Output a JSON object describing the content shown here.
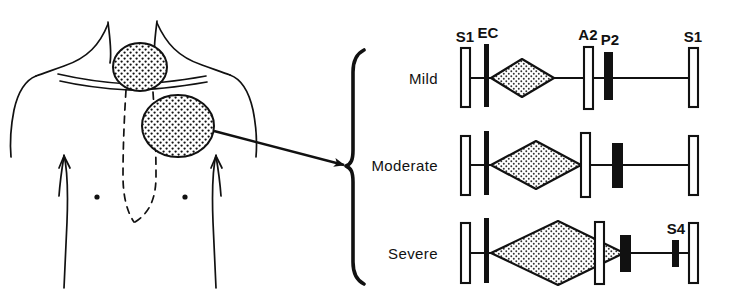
{
  "figure": {
    "background_color": "#ffffff",
    "ink_color": "#111111"
  },
  "anatomy": {
    "name": "chest-torso-diagram",
    "description": "Anterior chest outline with neck, clavicles, shoulders, sternum midline and two stippled auscultation areas",
    "nipple_marks": 2,
    "auscultation_areas": [
      {
        "name": "suprasternal-notch-area",
        "fill": "stipple"
      },
      {
        "name": "left-upper-sternal-border-area",
        "fill": "stipple"
      }
    ],
    "pointer": {
      "name": "arrow-to-phonocardiograms",
      "direction": "right-down"
    },
    "brace": {
      "name": "grouping-brace",
      "glyph": "{"
    }
  },
  "phonocardiogram": {
    "event_labels": {
      "s1": "S1",
      "ec": "EC",
      "a2": "A2",
      "p2": "P2",
      "s1_end": "S1",
      "s4": "S4"
    },
    "legend_colors": {
      "hollow_bar": "#ffffff",
      "hollow_bar_border": "#111111",
      "solid_bar": "#111111",
      "murmur_fill": "#d8d8d8",
      "murmur_outline": "#111111"
    },
    "rows": [
      {
        "label": "Mild",
        "severity": "mild",
        "markers": [
          {
            "id": "s1",
            "label": "S1",
            "type": "hollow",
            "show_label": true
          },
          {
            "id": "ec",
            "label": "EC",
            "type": "solid-tall",
            "show_label": true
          },
          {
            "id": "a2",
            "label": "A2",
            "type": "hollow",
            "show_label": true
          },
          {
            "id": "p2",
            "label": "P2",
            "type": "solid",
            "show_label": true
          },
          {
            "id": "s1_end",
            "label": "S1",
            "type": "hollow",
            "show_label": true
          }
        ],
        "murmur": {
          "shape": "diamond",
          "size": "small"
        },
        "a2_p2_split": "narrow",
        "has_s4": false
      },
      {
        "label": "Moderate",
        "severity": "moderate",
        "markers": [
          {
            "id": "s1",
            "label": "S1",
            "type": "hollow",
            "show_label": false
          },
          {
            "id": "ec",
            "label": "EC",
            "type": "solid-tall",
            "show_label": false
          },
          {
            "id": "a2",
            "label": "A2",
            "type": "hollow",
            "show_label": false
          },
          {
            "id": "p2",
            "label": "P2",
            "type": "solid",
            "show_label": false
          },
          {
            "id": "s1_end",
            "label": "S1",
            "type": "hollow",
            "show_label": false
          }
        ],
        "murmur": {
          "shape": "diamond",
          "size": "medium"
        },
        "a2_p2_split": "wide",
        "has_s4": false
      },
      {
        "label": "Severe",
        "severity": "severe",
        "markers": [
          {
            "id": "s1",
            "label": "S1",
            "type": "hollow",
            "show_label": false
          },
          {
            "id": "ec",
            "label": "EC",
            "type": "solid-tall",
            "show_label": false
          },
          {
            "id": "a2",
            "label": "A2",
            "type": "hollow",
            "show_label": false
          },
          {
            "id": "p2",
            "label": "P2",
            "type": "solid",
            "show_label": false
          },
          {
            "id": "s4",
            "label": "S4",
            "type": "solid-small",
            "show_label": true
          },
          {
            "id": "s1_end",
            "label": "S1",
            "type": "hollow",
            "show_label": false
          }
        ],
        "murmur": {
          "shape": "diamond",
          "size": "large"
        },
        "a2_p2_split": "very-wide",
        "has_s4": true
      }
    ]
  }
}
